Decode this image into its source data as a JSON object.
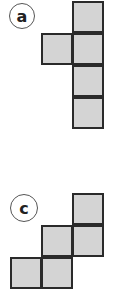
{
  "figures": [
    {
      "id": "a",
      "label": "a",
      "label_circle": {
        "cx": 22,
        "cy": 16,
        "r": 13
      },
      "square_size": 32,
      "fill_color": "#d4d4d4",
      "stroke_color": "#2a2a2a",
      "squares": [
        {
          "x": 72,
          "y": 1
        },
        {
          "x": 41,
          "y": 33
        },
        {
          "x": 72,
          "y": 33
        },
        {
          "x": 72,
          "y": 65
        },
        {
          "x": 72,
          "y": 97
        }
      ]
    },
    {
      "id": "c",
      "label": "c",
      "label_circle": {
        "cx": 24,
        "cy": 208,
        "r": 14
      },
      "square_size": 32,
      "fill_color": "#d4d4d4",
      "stroke_color": "#2a2a2a",
      "squares": [
        {
          "x": 72,
          "y": 193
        },
        {
          "x": 41,
          "y": 225
        },
        {
          "x": 72,
          "y": 225
        },
        {
          "x": 10,
          "y": 257
        },
        {
          "x": 41,
          "y": 257
        }
      ]
    }
  ]
}
